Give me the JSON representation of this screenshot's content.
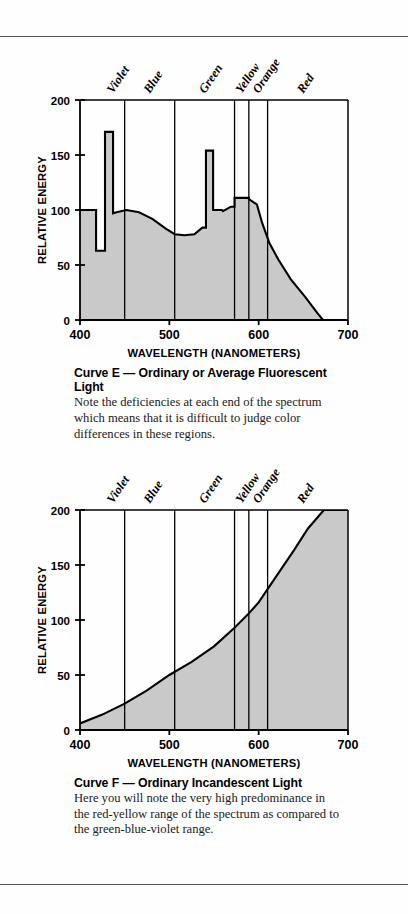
{
  "page": {
    "background_color": "#fefefe",
    "rule_color": "#55565a",
    "fill_color": "#c9c9c9",
    "line_color": "#000000"
  },
  "figures": [
    {
      "id": "curve-e",
      "caption_title": "Curve E — Ordinary or Average Fluorescent Light",
      "caption_body": "Note the deficiencies at each end of the spectrum which means that it is difficult to judge color differences in these regions."
    },
    {
      "id": "curve-f",
      "caption_title": "Curve F — Ordinary Incandescent Light",
      "caption_body": "Here you will note the very high predominance in the red-yellow range of the spectrum as compared to the green-blue-violet range."
    }
  ],
  "chart_data": [
    {
      "type": "area",
      "id": "curve-e",
      "title": "Curve E — Ordinary or Average Fluorescent Light",
      "xlabel": "WAVELENGTH (NANOMETERS)",
      "ylabel": "RELATIVE ENERGY",
      "xlim": [
        400,
        700
      ],
      "ylim": [
        0,
        200
      ],
      "xticks": [
        400,
        500,
        600,
        700
      ],
      "xticklabels": [
        "400",
        "500",
        "600",
        "700"
      ],
      "yticks": [
        0,
        50,
        100,
        150,
        200
      ],
      "yticklabels": [
        "0",
        "50",
        "100",
        "150",
        "200"
      ],
      "grid": false,
      "legend": "none",
      "band_labels": [
        "Violet",
        "Blue",
        "Green",
        "Yellow",
        "Orange",
        "Red"
      ],
      "band_boundaries_nm": [
        450,
        506,
        573,
        589,
        610
      ],
      "annotations": [
        "Narrow violet mercury spike reaching 171 near 430 nm",
        "Green mercury spike reaching 154 near 545 nm",
        "Yellow-orange plateau near 110 between 580 and 600 nm",
        "Energy falls to zero near 672 nm"
      ],
      "x": [
        400,
        418,
        418,
        428,
        428,
        431,
        437,
        437,
        441,
        452,
        466,
        481,
        496,
        506,
        517,
        528,
        537,
        541,
        541,
        549,
        549,
        559,
        560,
        569,
        573,
        573,
        584,
        589,
        589,
        598,
        604,
        612,
        622,
        636,
        652,
        666,
        672,
        700
      ],
      "y": [
        100,
        100,
        63,
        63,
        171,
        171,
        171,
        97,
        98,
        100,
        98,
        92,
        83,
        78,
        77,
        78,
        84,
        84,
        154,
        154,
        100,
        100,
        99,
        103,
        103,
        111,
        111,
        111,
        110,
        105,
        88,
        70,
        55,
        37,
        21,
        6,
        0,
        0
      ]
    },
    {
      "type": "area",
      "id": "curve-f",
      "title": "Curve F — Ordinary Incandescent Light",
      "xlabel": "WAVELENGTH (NANOMETERS)",
      "ylabel": "RELATIVE ENERGY",
      "xlim": [
        400,
        700
      ],
      "ylim": [
        0,
        200
      ],
      "xticks": [
        400,
        500,
        600,
        700
      ],
      "xticklabels": [
        "400",
        "500",
        "600",
        "700"
      ],
      "yticks": [
        0,
        50,
        100,
        150,
        200
      ],
      "yticklabels": [
        "0",
        "50",
        "100",
        "150",
        "200"
      ],
      "grid": false,
      "legend": "none",
      "band_labels": [
        "Violet",
        "Blue",
        "Green",
        "Yellow",
        "Orange",
        "Red"
      ],
      "band_boundaries_nm": [
        450,
        506,
        573,
        589,
        610
      ],
      "annotations": [
        "Smoothly rising curve from about 6 at 400 nm to 200 at about 673 nm",
        "Curve reaches the top of the plot near 673 nm and is clipped thereafter"
      ],
      "x": [
        400,
        425,
        450,
        475,
        500,
        525,
        550,
        573,
        589,
        600,
        610,
        625,
        640,
        655,
        673,
        700
      ],
      "y": [
        6,
        14,
        24,
        36,
        50,
        62,
        76,
        93,
        106,
        116,
        128,
        146,
        164,
        183,
        200,
        200
      ]
    }
  ]
}
